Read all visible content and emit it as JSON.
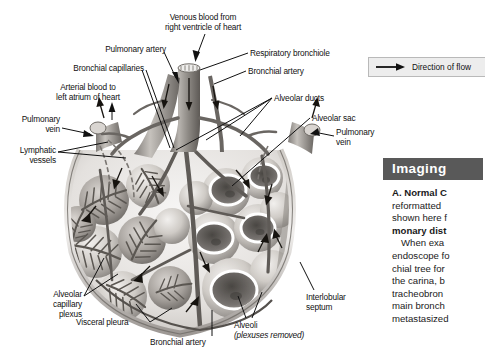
{
  "figure": {
    "background_color": "#ffffff",
    "style": "grayscale anatomical illustration"
  },
  "labels": {
    "venous_blood": "Venous blood from\nright ventricle of heart",
    "venous_blood_line1": "Venous blood from",
    "venous_blood_line2": "right ventricle of heart",
    "pulmonary_artery": "Pulmonary artery",
    "bronchial_capillaries": "Bronchial capillaries",
    "arterial_blood_line1": "Arterial blood to",
    "arterial_blood_line2": "left atrium of heart",
    "pulmonary_vein_left_line1": "Pulmonary",
    "pulmonary_vein_left_line2": "vein",
    "lymphatic_vessels_line1": "Lymphatic",
    "lymphatic_vessels_line2": "vessels",
    "respiratory_bronchiole": "Respiratory bronchiole",
    "bronchial_artery_top": "Bronchial artery",
    "alveolar_ducts": "Alveolar ducts",
    "alveolar_sac": "Alveolar sac",
    "pulmonary_vein_right_line1": "Pulmonary",
    "pulmonary_vein_right_line2": "vein",
    "alveolar_capillary_plexus_line1": "Alveolar",
    "alveolar_capillary_plexus_line2": "capillary",
    "alveolar_capillary_plexus_line3": "plexus",
    "visceral_pleura": "Visceral pleura",
    "bronchial_artery_bottom": "Bronchial artery",
    "alveoli": "Alveoli",
    "alveoli_note": "(plexuses removed)",
    "interlobular_septum_line1": "Interlobular",
    "interlobular_septum_line2": "septum"
  },
  "legend": {
    "arrow_icon": "right-arrow-icon",
    "text": "Direction of flow",
    "background_color": "#ededed",
    "border_color": "#b9b9b9"
  },
  "imaging_panel": {
    "header": "Imaging",
    "header_background": "#595959",
    "header_text_color": "#ffffff",
    "lines": [
      {
        "text": "A. Normal C",
        "bold": true,
        "indent": false
      },
      {
        "text": "reformatted",
        "bold": false,
        "indent": false
      },
      {
        "text": "shown here f",
        "bold": false,
        "indent": false
      },
      {
        "text": "monary dist",
        "bold": true,
        "indent": false
      },
      {
        "text": "When exa",
        "bold": false,
        "indent": true
      },
      {
        "text": "endoscope fo",
        "bold": false,
        "indent": false
      },
      {
        "text": "chial tree for",
        "bold": false,
        "indent": false
      },
      {
        "text": "the carina, b",
        "bold": false,
        "indent": false
      },
      {
        "text": "tracheobron",
        "bold": false,
        "indent": false
      },
      {
        "text": "main bronch",
        "bold": false,
        "indent": false
      },
      {
        "text": "metastasized",
        "bold": false,
        "indent": false
      }
    ]
  }
}
